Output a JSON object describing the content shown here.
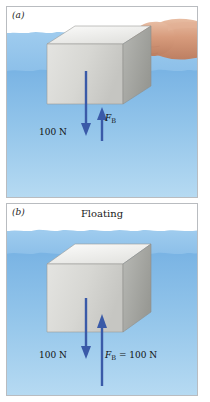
{
  "figure": {
    "colors": {
      "water_far": "#8dc0e9",
      "water_near": "#7ab4e4",
      "water_deep": "#b6daf2",
      "arrow_blue": "#3a5aa8",
      "cube_front": "#d9d9d6",
      "cube_top": "#f1f1ef",
      "cube_side": "#a9aaa6",
      "skin": "#d9a183",
      "panel_border": "#b9bcc0",
      "text": "#111111"
    }
  },
  "panels": [
    {
      "id": "panel-a",
      "label": "(a)",
      "caption": "",
      "block_state": "submerged-held-by-hand",
      "hand_present": true,
      "forces": [
        {
          "name": "weight",
          "label": "100 N",
          "direction": "down",
          "value": 100,
          "unit": "N"
        },
        {
          "name": "buoyant-force",
          "symbol": "F",
          "subscript": "B",
          "label_suffix": "",
          "direction": "up",
          "value": null,
          "unit": "N"
        }
      ]
    },
    {
      "id": "panel-b",
      "label": "(b)",
      "caption": "Floating",
      "block_state": "floating",
      "hand_present": false,
      "forces": [
        {
          "name": "weight",
          "label": "100 N",
          "direction": "down",
          "value": 100,
          "unit": "N"
        },
        {
          "name": "buoyant-force",
          "symbol": "F",
          "subscript": "B",
          "label_suffix": " = 100 N",
          "direction": "up",
          "value": 100,
          "unit": "N"
        }
      ]
    }
  ]
}
